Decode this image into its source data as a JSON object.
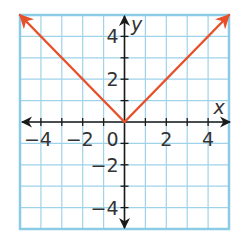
{
  "chart_data": {
    "type": "line",
    "title": "",
    "xlabel": "x",
    "ylabel": "y",
    "xlim": [
      -5,
      5
    ],
    "ylim": [
      -5,
      5
    ],
    "grid": true,
    "x_ticks": [
      -4,
      -2,
      0,
      2,
      4
    ],
    "y_ticks": [
      -4,
      -2,
      2,
      4
    ],
    "x_tick_labels": [
      "−4",
      "−2",
      "0",
      "2",
      "4"
    ],
    "y_tick_labels": [
      "−4",
      "−2",
      "2",
      "4"
    ],
    "series": [
      {
        "name": "y = |x|",
        "points": [
          [
            -5,
            5
          ],
          [
            0,
            0
          ],
          [
            5,
            5
          ]
        ],
        "arrows": "both-ends",
        "color": "#e8502a"
      }
    ],
    "legend": null
  },
  "colors": {
    "grid": "#9fd3ea",
    "border": "#8ccbe6",
    "axes": "#1a1a1a",
    "line": "#e8502a"
  }
}
